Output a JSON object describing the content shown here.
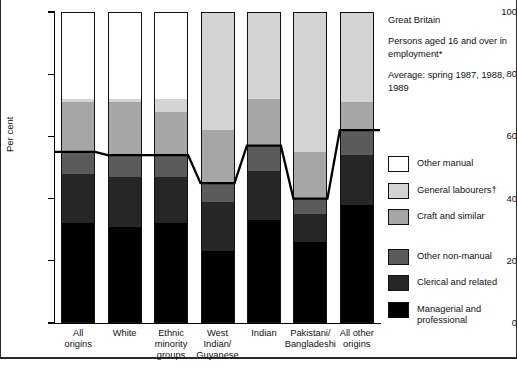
{
  "header": {
    "region": "Great Britain",
    "population": "Persons aged 16 and over in employment*",
    "period": "Average: spring 1987, 1988, 1989"
  },
  "axis": {
    "ylabel": "Per cent",
    "yticks": [
      "0",
      "20",
      "40",
      "60",
      "80",
      "100"
    ]
  },
  "legend": {
    "items": [
      {
        "label": "Other manual",
        "color": "#ffffff"
      },
      {
        "label": "General labourers†",
        "color": "#d4d4d4"
      },
      {
        "label": "Craft and similar",
        "color": "#a6a6a6"
      },
      {
        "label": "Other non-manual",
        "color": "#5b5b5b"
      },
      {
        "label": "Clerical and related",
        "color": "#262626"
      },
      {
        "label": "Managerial and\nprofessional",
        "color": "#000000"
      }
    ]
  },
  "chart_data": {
    "type": "bar",
    "title": "",
    "subtitle": "Great Britain — Persons aged 16 and over in employment*",
    "xlabel": "",
    "ylabel": "Per cent",
    "ylim": [
      0,
      100
    ],
    "yticks": [
      0,
      20,
      40,
      60,
      80,
      100
    ],
    "grid": false,
    "stacked": true,
    "legend_position": "right",
    "categories": [
      "All origins",
      "White",
      "Ethnic minority groups",
      "West Indian/ Guyanese",
      "Indian",
      "Pakistani/ Bangladeshi",
      "All other origins"
    ],
    "category_lines": [
      [
        "All",
        "origins"
      ],
      [
        "White"
      ],
      [
        "Ethnic",
        "minority",
        "groups"
      ],
      [
        "West",
        "Indian/",
        "Guyanese"
      ],
      [
        "Indian"
      ],
      [
        "Pakistani/",
        "Bangladeshi"
      ],
      [
        "All other",
        "origins"
      ]
    ],
    "series": [
      {
        "name": "Managerial and professional",
        "color": "#000000",
        "values": [
          32,
          31,
          32,
          23,
          33,
          26,
          38
        ]
      },
      {
        "name": "Clerical and related",
        "color": "#262626",
        "values": [
          16,
          16,
          15,
          16,
          16,
          9,
          16
        ]
      },
      {
        "name": "Other non-manual",
        "color": "#5b5b5b",
        "values": [
          7,
          7,
          7,
          6,
          8,
          5,
          8
        ]
      },
      {
        "name": "Craft and similar",
        "color": "#a6a6a6",
        "values": [
          16,
          17,
          14,
          17,
          15,
          15,
          9
        ]
      },
      {
        "name": "General labourers†",
        "color": "#d4d4d4",
        "values": [
          1,
          1,
          4,
          38,
          28,
          45,
          29
        ]
      },
      {
        "name": "Other manual",
        "color": "#ffffff",
        "values": [
          28,
          28,
          28,
          0,
          0,
          0,
          0
        ]
      }
    ],
    "overlay_line": {
      "name": "Non-manual / manual boundary",
      "color": "#000000",
      "values": [
        55,
        54,
        54,
        45,
        57,
        40,
        62
      ]
    },
    "annotations": [
      "Average: spring 1987, 1988, 1989"
    ]
  }
}
